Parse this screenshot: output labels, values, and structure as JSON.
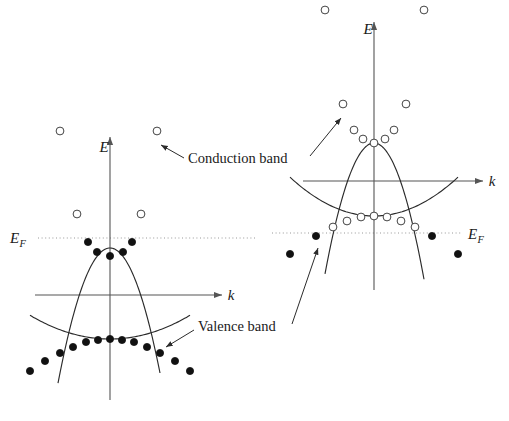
{
  "figure": {
    "width": 509,
    "height": 421,
    "background": "#ffffff"
  },
  "annotations": {
    "conduction_band_label": "Conduction band",
    "valence_band_label": "Valence band"
  },
  "axis_labels": {
    "energy": "E",
    "wavevector": "k",
    "fermi": "E",
    "fermi_subscript": "F"
  },
  "colors": {
    "axis": "#555555",
    "curve": "#2b2b2b",
    "fermi_line": "#8d8d8d",
    "filled_marker": "#111111",
    "open_marker_stroke": "#3a3a3a",
    "open_marker_fill": "#ffffff",
    "text": "#1a1a1a"
  },
  "legend_semantics": {
    "filled_circle": "occupied electron state",
    "open_circle": "unoccupied state (hole)"
  },
  "chart_data": {
    "type": "scatter",
    "xlabel": "k",
    "ylabel": "E",
    "grid": false,
    "legend_position": "none",
    "panels": [
      {
        "name": "left-panel",
        "description": "Semiconductor near ground state: valence band fully occupied, conduction band minimum partially filled",
        "origin": {
          "x": 110,
          "y": 295
        },
        "k_axis": {
          "y": 295,
          "x_start": 35,
          "x_end": 222,
          "label": "k",
          "label_x": 231,
          "label_y": 300
        },
        "e_axis": {
          "x": 110,
          "y_start": 400,
          "y_end": 137,
          "label": "E",
          "label_x": 104,
          "label_y": 152
        },
        "fermi_level": {
          "y": 238,
          "x_start": 38,
          "x_end": 255,
          "label_x": 10,
          "label_y": 243
        },
        "conduction_band": {
          "vertex": {
            "x": 110,
            "y": 248
          },
          "curvature": 0.05,
          "x_min": 58,
          "x_max": 160,
          "markers": [
            {
              "x": 60,
              "y": 131,
              "type": "open"
            },
            {
              "x": 77,
              "y": 214,
              "type": "open"
            },
            {
              "x": 88,
              "y": 242,
              "type": "filled"
            },
            {
              "x": 97,
              "y": 252,
              "type": "filled"
            },
            {
              "x": 110,
              "y": 256,
              "type": "filled"
            },
            {
              "x": 123,
              "y": 252,
              "type": "filled"
            },
            {
              "x": 132,
              "y": 242,
              "type": "filled"
            },
            {
              "x": 141,
              "y": 214,
              "type": "open"
            },
            {
              "x": 157,
              "y": 131,
              "type": "open"
            }
          ]
        },
        "valence_band": {
          "vertex": {
            "x": 110,
            "y": 339
          },
          "curvature": -0.0037,
          "x_min": 30,
          "x_max": 190,
          "markers": [
            {
              "x": 30,
              "y": 371,
              "type": "filled"
            },
            {
              "x": 45,
              "y": 361,
              "type": "filled"
            },
            {
              "x": 60,
              "y": 353,
              "type": "filled"
            },
            {
              "x": 73,
              "y": 347,
              "type": "filled"
            },
            {
              "x": 86,
              "y": 342,
              "type": "filled"
            },
            {
              "x": 98,
              "y": 340,
              "type": "filled"
            },
            {
              "x": 110,
              "y": 339,
              "type": "filled"
            },
            {
              "x": 122,
              "y": 340,
              "type": "filled"
            },
            {
              "x": 134,
              "y": 342,
              "type": "filled"
            },
            {
              "x": 147,
              "y": 347,
              "type": "filled"
            },
            {
              "x": 160,
              "y": 353,
              "type": "filled"
            },
            {
              "x": 175,
              "y": 361,
              "type": "filled"
            },
            {
              "x": 190,
              "y": 371,
              "type": "filled"
            }
          ]
        }
      },
      {
        "name": "right-panel",
        "description": "Excited state: conduction band entirely unoccupied above, valence band top emptied leaving holes",
        "origin": {
          "x": 374,
          "y": 181
        },
        "k_axis": {
          "y": 181,
          "x_start": 303,
          "x_end": 483,
          "label": "k",
          "label_x": 492,
          "label_y": 186
        },
        "e_axis": {
          "x": 374,
          "y_start": 290,
          "y_end": 22,
          "label": "E",
          "label_x": 368,
          "label_y": 34
        },
        "fermi_level": {
          "y": 233,
          "x_start": 272,
          "x_end": 462,
          "label_x": 468,
          "label_y": 239
        },
        "conduction_band": {
          "vertex": {
            "x": 374,
            "y": 143
          },
          "curvature": 0.0545,
          "x_min": 325,
          "x_max": 424,
          "markers": [
            {
              "x": 325,
              "y": 10,
              "type": "open"
            },
            {
              "x": 343,
              "y": 104,
              "type": "open"
            },
            {
              "x": 354,
              "y": 130,
              "type": "open"
            },
            {
              "x": 363,
              "y": 139,
              "type": "open"
            },
            {
              "x": 374,
              "y": 143,
              "type": "open"
            },
            {
              "x": 385,
              "y": 139,
              "type": "open"
            },
            {
              "x": 394,
              "y": 130,
              "type": "open"
            },
            {
              "x": 406,
              "y": 104,
              "type": "open"
            },
            {
              "x": 424,
              "y": 10,
              "type": "open"
            }
          ]
        },
        "valence_band": {
          "vertex": {
            "x": 374,
            "y": 216
          },
          "curvature": -0.0055,
          "x_min": 290,
          "x_max": 458,
          "markers": [
            {
              "x": 290,
              "y": 254,
              "type": "filled"
            },
            {
              "x": 316,
              "y": 236,
              "type": "filled"
            },
            {
              "x": 333,
              "y": 227,
              "type": "open"
            },
            {
              "x": 347,
              "y": 221,
              "type": "open"
            },
            {
              "x": 361,
              "y": 217,
              "type": "open"
            },
            {
              "x": 374,
              "y": 216,
              "type": "open"
            },
            {
              "x": 387,
              "y": 217,
              "type": "open"
            },
            {
              "x": 401,
              "y": 221,
              "type": "open"
            },
            {
              "x": 415,
              "y": 227,
              "type": "open"
            },
            {
              "x": 432,
              "y": 236,
              "type": "filled"
            },
            {
              "x": 458,
              "y": 254,
              "type": "filled"
            }
          ]
        }
      }
    ],
    "callouts": [
      {
        "name": "conduction-band-callout",
        "label": "Conduction band",
        "text_x": 188,
        "text_y": 163,
        "leaders": [
          {
            "from_x": 184,
            "from_y": 158,
            "to_x": 161,
            "to_y": 145
          },
          {
            "from_x": 310,
            "from_y": 156,
            "to_x": 341,
            "to_y": 118
          }
        ]
      },
      {
        "name": "valence-band-callout",
        "label": "Valence band",
        "text_x": 198,
        "text_y": 331,
        "leaders": [
          {
            "from_x": 194,
            "from_y": 330,
            "to_x": 166,
            "to_y": 347
          },
          {
            "from_x": 292,
            "from_y": 324,
            "to_x": 318,
            "to_y": 248
          }
        ]
      }
    ]
  }
}
